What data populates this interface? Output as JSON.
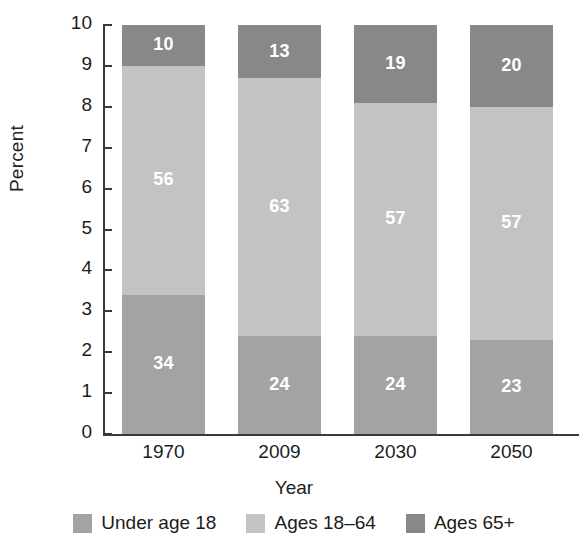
{
  "chart_data": {
    "type": "bar",
    "stacked": true,
    "title": "",
    "xlabel": "Year",
    "ylabel": "Percent",
    "categories": [
      "1970",
      "2009",
      "2030",
      "2050"
    ],
    "ylim": [
      0,
      10
    ],
    "yticks": [
      "0",
      "1",
      "2",
      "3",
      "4",
      "5",
      "6",
      "7",
      "8",
      "9",
      "10"
    ],
    "grid": false,
    "legend_position": "bottom",
    "note": "Axis is in units of ten percent; segment data labels are percentages summing to 100 per bar.",
    "series": [
      {
        "name": "Under age 18",
        "color": "#a3a3a3",
        "values": [
          34,
          24,
          24,
          23
        ],
        "axis_values": [
          3.4,
          2.4,
          2.4,
          2.3
        ]
      },
      {
        "name": "Ages 18–64",
        "color": "#c3c3c3",
        "values": [
          56,
          63,
          57,
          57
        ],
        "axis_values": [
          5.6,
          6.3,
          5.7,
          5.7
        ]
      },
      {
        "name": "Ages 65+",
        "color": "#888888",
        "values": [
          10,
          13,
          19,
          20
        ],
        "axis_values": [
          1.0,
          1.3,
          1.9,
          2.0
        ]
      }
    ]
  },
  "legend": {
    "items": [
      {
        "label": "Under age 18",
        "color": "#a3a3a3"
      },
      {
        "label": "Ages 18–64",
        "color": "#c3c3c3"
      },
      {
        "label": "Ages 65+",
        "color": "#888888"
      }
    ]
  },
  "axis": {
    "y_title": "Percent",
    "x_title": "Year"
  }
}
